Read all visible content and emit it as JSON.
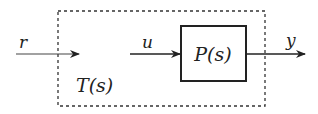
{
  "diagram": {
    "type": "block-diagram",
    "outer_block": {
      "label": "T(s)",
      "style": "dashed"
    },
    "inner_block": {
      "label": "P(s)",
      "style": "solid"
    },
    "signals": {
      "input": "r",
      "control": "u",
      "output": "y"
    },
    "colors": {
      "stroke": "#222222",
      "background": "#ffffff"
    }
  }
}
